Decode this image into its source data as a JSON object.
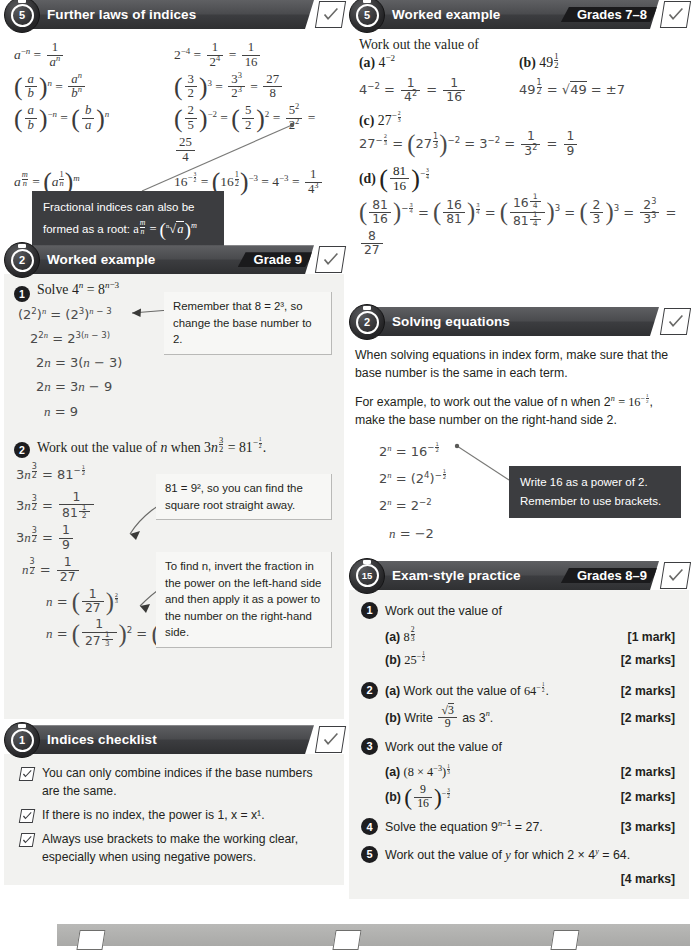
{
  "sections": {
    "further_laws": {
      "badge": "5",
      "title": "Further laws of indices",
      "grade": "",
      "callout": {
        "line1": "Fractional indices can also be",
        "line2_prefix": "formed as a root: ",
        "line2_math": "a^(m/n) = (n√a)^m"
      },
      "rules": [
        {
          "left": "a^-n = 1/a^n",
          "right": "2^-4 = 1/2^4 = 1/16"
        },
        {
          "left": "(a/b)^n = a^n/b^n",
          "right": "(3/2)^3 = 3^3/2^3 = 27/8"
        },
        {
          "left": "(a/b)^-n = (b/a)^n",
          "right": "(2/5)^-2 = (5/2)^2 = 5^2/2^2 = 25/4"
        },
        {
          "left": "a^(m/n) = (a^(1/n))^m",
          "right": "16^(-3/2) = (16^(1/2))^-3 = 4^-3 = 1/4^3 = 1/64"
        }
      ]
    },
    "worked_example_right": {
      "badge": "5",
      "title": "Worked example",
      "grade": "Grades 7–8",
      "intro": "Work out the value of",
      "parts": [
        {
          "label": "(a)",
          "question": "4^-2",
          "working": "4^-2 = 1/4^2 = 1/16"
        },
        {
          "label": "(b)",
          "question": "49^(1/2)",
          "working": "49^(1/2) = √49 = ±7"
        },
        {
          "label": "(c)",
          "question": "27^(-2/3)",
          "working": "27^(-2/3) = (27^(1/3))^-2 = 3^-2 = 1/3^2 = 1/9"
        },
        {
          "label": "(d)",
          "question": "(81/16)^(-3/4)",
          "working": "(81/16)^(-3/4) = (16/81)^(3/4) = (16^(1/4)/81^(1/4))^3 = (2/3)^3 = 2^3/3^3 = 8/27"
        }
      ]
    },
    "worked_example_left": {
      "badge": "2",
      "title": "Worked example",
      "grade": "Grade 9",
      "q1": {
        "num": "1",
        "prompt": "Solve 4^n = 8^(n−3)",
        "steps": [
          "(2^2)^n = (2^3)^(n − 3)",
          "2^(2n) = 2^(3(n − 3))",
          "2n = 3(n − 3)",
          "2n = 3n − 9",
          "n = 9"
        ],
        "callout": "Remember that 8 = 2³, so change the base number to 2."
      },
      "q2": {
        "num": "2",
        "prompt": "Work out the value of n when 3n^(3/2) = 81^(-1/2).",
        "steps": [
          "3n^(3/2) = 81^(-1/2)",
          "3n^(3/2) = 1/81^(1/2)",
          "3n^(3/2) = 1/9",
          "n^(3/2) = 1/27",
          "n = (1/27)^(2/3)",
          "n = (1/27^(1/3))^2 = (1/3)^2 = 1/9"
        ],
        "callout1": "81 = 9², so you can find the square root straight away.",
        "callout2": "To find n, invert the fraction in the power on the left-hand side and then apply it as a power to the number on the right-hand side."
      }
    },
    "solving_equations": {
      "badge": "2",
      "title": "Solving equations",
      "grade": "",
      "para1": "When solving equations in index form, make sure that the base number is the same in each term.",
      "para2_a": "For example, to work out the value of n when 2",
      "para2_b": ", make the base number on the right-hand side 2.",
      "steps": [
        "2^n = 16^(-1/2)",
        "2^n = (2^4)^(-1/2)",
        "2^n = 2^-2",
        "n = −2"
      ],
      "callout_line1": "Write 16 as a power of 2.",
      "callout_line2": "Remember to use brackets."
    },
    "checklist": {
      "badge": "1",
      "title": "Indices checklist",
      "grade": "",
      "items": [
        "You can only combine indices if the base numbers are the same.",
        "If there is no index, the power is 1, x = x¹.",
        "Always use brackets to make the working clear, especially when using negative powers."
      ]
    },
    "exam_practice": {
      "badge": "15",
      "title": "Exam-style practice",
      "grade": "Grades 8–9",
      "questions": [
        {
          "num": "1",
          "stem": "Work out the value of",
          "subs": [
            {
              "label": "(a)",
              "body": "8^(2/3)",
              "marks": "[1 mark]"
            },
            {
              "label": "(b)",
              "body": "25^(-1/2)",
              "marks": "[2 marks]"
            }
          ]
        },
        {
          "num": "2",
          "stem": "",
          "subs": [
            {
              "label": "(a)",
              "body": "Work out the value of 64^(-1/2).",
              "marks": "[2 marks]",
              "inline": true
            },
            {
              "label": "(b)",
              "body": "Write √3/9 as 3^n.",
              "marks": "[2 marks]"
            }
          ]
        },
        {
          "num": "3",
          "stem": "Work out the value of",
          "subs": [
            {
              "label": "(a)",
              "body": "(8 × 4^-3)^(1/3)",
              "marks": "[2 marks]"
            },
            {
              "label": "(b)",
              "body": "(9/16)^(-3/2)",
              "marks": "[2 marks]"
            }
          ]
        },
        {
          "num": "4",
          "stem": "Solve the equation 9^(n−1) = 27.",
          "marks": "[3 marks]",
          "subs": []
        },
        {
          "num": "5",
          "stem": "Work out the value of y for which 2 × 4^y = 64.",
          "marks": "[4 marks]",
          "subs": []
        }
      ]
    }
  },
  "colors": {
    "banner_dark": "#4a4b4e",
    "grade_black": "#1a1a1c",
    "panel_grey": "#f2f2f0",
    "callout_dark": "#3c3d40",
    "text": "#231f20"
  }
}
